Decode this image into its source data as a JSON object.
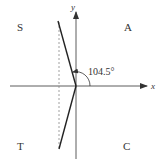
{
  "diagram": {
    "axes": {
      "x_label": "x",
      "y_label": "y"
    },
    "quadrants": {
      "q1": "A",
      "q2": "S",
      "q3": "T",
      "q4": "C"
    },
    "angle": {
      "label": "104.5°",
      "degrees": 104.5
    },
    "colors": {
      "line": "#222222",
      "axis": "#333333",
      "dashed": "#888888",
      "background": "#ffffff"
    }
  }
}
